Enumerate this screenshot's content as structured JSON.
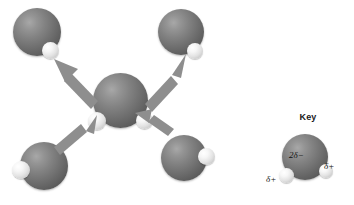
{
  "figure": {
    "background_color": "#ffffff",
    "width": 354,
    "height": 205
  },
  "palette": {
    "oxygen_color": "#6e6e6e",
    "hydrogen_color": "#e8e8e8",
    "arrow_color": "#8e8e8e",
    "text_color": "#111111"
  },
  "key": {
    "title": "Key",
    "oxygen_charge_label": "2δ−",
    "hydrogen_charge_label_left": "δ+",
    "hydrogen_charge_label_right": "δ+"
  },
  "molecules": [
    {
      "id": "center",
      "name": "central-water-molecule"
    },
    {
      "id": "top-left",
      "name": "water-molecule-top-left"
    },
    {
      "id": "top-right",
      "name": "water-molecule-top-right"
    },
    {
      "id": "bottom-left",
      "name": "water-molecule-bottom-left"
    },
    {
      "id": "bottom-right",
      "name": "water-molecule-bottom-right"
    }
  ],
  "arrows": [
    {
      "id": "to-top-left",
      "direction": "up-left",
      "meaning": "hydrogen bond"
    },
    {
      "id": "to-top-right",
      "direction": "up-right",
      "meaning": "hydrogen bond"
    },
    {
      "id": "from-bottom-left",
      "direction": "up-right",
      "meaning": "hydrogen bond"
    },
    {
      "id": "from-bottom-right",
      "direction": "up-left",
      "meaning": "hydrogen bond"
    }
  ]
}
